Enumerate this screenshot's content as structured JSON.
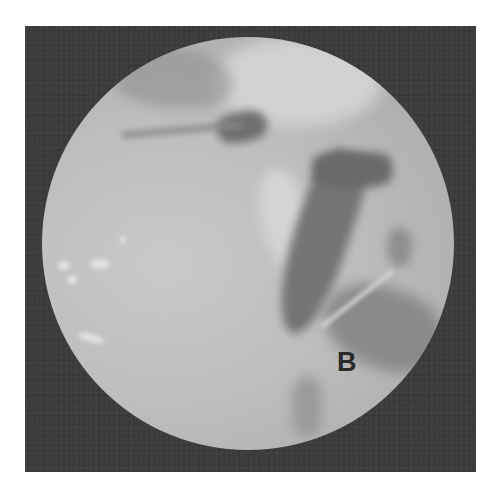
{
  "image": {
    "description": "Grayscale arthroscopic/endoscopic circular view on a dark square frame",
    "frame_color": "#3b3b3b",
    "scope_color": "#bdbdbd",
    "annotation_label": "B"
  }
}
